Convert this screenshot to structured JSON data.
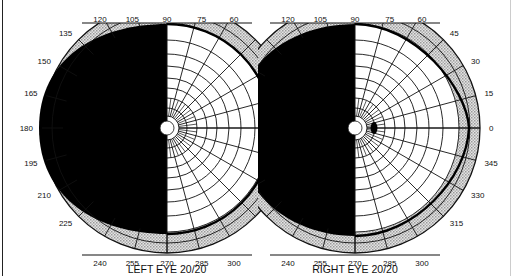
{
  "figure": {
    "left_eye": {
      "title": "LEFT EYE",
      "acuity": "20/20",
      "center": [
        167,
        128
      ],
      "outer_radius": 125,
      "angle_labels": [
        "120",
        "105",
        "90",
        "75",
        "60",
        "135",
        "150",
        "165",
        "180",
        "195",
        "210",
        "225",
        "240",
        "255",
        "270",
        "285",
        "300"
      ],
      "field_loss": "Left homonymous hemianopia — entire left (temporal) half field blacked out",
      "blind_spot": "not marked"
    },
    "right_eye": {
      "title": "RIGHT EYE",
      "acuity": "20/20",
      "center": [
        355,
        128
      ],
      "outer_radius": 125,
      "angle_labels": [
        "120",
        "105",
        "90",
        "75",
        "60",
        "45",
        "30",
        "15",
        "0",
        "345",
        "330",
        "315",
        "240",
        "255",
        "270",
        "285",
        "300"
      ],
      "field_loss": "Left (nasal) half field blacked out",
      "blind_spot": "small black oval at ~15° temporal on 0° meridian"
    },
    "colors": {
      "field_loss": "#000000",
      "grid": "#111111",
      "peripheral_band": "#c8c8c8",
      "background": "#ffffff"
    }
  }
}
